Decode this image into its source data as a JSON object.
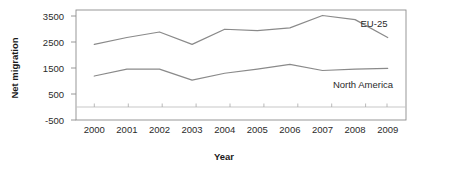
{
  "chart_data": {
    "type": "line",
    "title": "",
    "xlabel": "Year",
    "ylabel": "Net migration",
    "categories": [
      "2000",
      "2001",
      "2002",
      "2003",
      "2004",
      "2005",
      "2006",
      "2007",
      "2008",
      "2009"
    ],
    "x": [
      2000,
      2001,
      2002,
      2003,
      2004,
      2005,
      2006,
      2007,
      2008,
      2009
    ],
    "series": [
      {
        "name": "EU-25",
        "label": "EU-25",
        "values": [
          2250,
          2500,
          2700,
          2250,
          2800,
          2750,
          2850,
          3300,
          3150,
          2500
        ],
        "color": "#8a8a8a"
      },
      {
        "name": "North America",
        "label": "North America",
        "values": [
          1100,
          1350,
          1350,
          950,
          1200,
          1350,
          1520,
          1300,
          1350,
          1380
        ],
        "color": "#8a8a8a"
      }
    ],
    "ylim": [
      -500,
      3500
    ],
    "ytick_labels": [
      "3500",
      "2500",
      "1500",
      "500",
      "-500"
    ],
    "yticks": [
      3500,
      2500,
      1500,
      500,
      -500
    ],
    "xlim": [
      1999.6,
      2009.4
    ],
    "grid": false,
    "legend_position": "inline-right",
    "zero_line": 0
  },
  "axis": {
    "y_title": "Net migration",
    "x_title": "Year"
  },
  "labels": {
    "eu25": "EU-25",
    "north_america": "North America"
  }
}
